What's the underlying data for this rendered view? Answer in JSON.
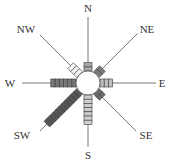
{
  "center": {
    "x": 88,
    "y": 83,
    "r": 12
  },
  "segment": {
    "length": 4.2,
    "width": 8
  },
  "directions": [
    {
      "label": "N",
      "angle": 0,
      "segments": 2,
      "fill": "#a8a8a8",
      "line_to": 66,
      "label_pos": [
        88,
        12
      ]
    },
    {
      "label": "NE",
      "angle": 45,
      "segments": 2,
      "fill": "#7a7a7a",
      "line_to": 70,
      "label_pos": [
        147,
        33
      ]
    },
    {
      "label": "E",
      "angle": 90,
      "segments": 3,
      "fill": "#bdbdbd",
      "line_to": 68,
      "label_pos": [
        162,
        87
      ]
    },
    {
      "label": "SE",
      "angle": 135,
      "segments": 2,
      "fill": "#6a6a6a",
      "line_to": 68,
      "label_pos": [
        146,
        139
      ]
    },
    {
      "label": "S",
      "angle": 180,
      "segments": 7,
      "fill": "#cfcfcf",
      "line_to": 64,
      "label_pos": [
        88,
        159
      ]
    },
    {
      "label": "SW",
      "angle": 225,
      "segments": 11,
      "fill": "#555555",
      "line_to": 68,
      "label_pos": [
        22,
        139
      ]
    },
    {
      "label": "W",
      "angle": 270,
      "segments": 6,
      "fill": "#777777",
      "line_to": 66,
      "label_pos": [
        10,
        87
      ]
    },
    {
      "label": "NW",
      "angle": 315,
      "segments": 3,
      "fill": "#f4f4f4",
      "line_to": 68,
      "label_pos": [
        26,
        33
      ]
    }
  ]
}
